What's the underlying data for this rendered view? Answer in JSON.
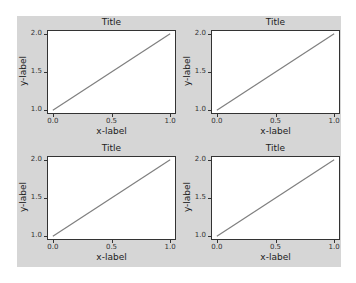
{
  "figure": {
    "background": "#d6d6d6",
    "line_color": "#7f7f7f"
  },
  "chart_data": [
    {
      "type": "line",
      "position": "top-left",
      "title": "Title",
      "xlabel": "x-label",
      "ylabel": "y-label",
      "x": [
        0,
        1
      ],
      "series": [
        {
          "name": "line",
          "values": [
            1,
            2
          ]
        }
      ],
      "xticks": [
        "0.0",
        "0.5",
        "1.0"
      ],
      "yticks": [
        "1.0",
        "1.5",
        "2.0"
      ],
      "xlim": [
        -0.05,
        1.05
      ],
      "ylim": [
        0.95,
        2.05
      ],
      "grid": false
    },
    {
      "type": "line",
      "position": "top-right",
      "title": "Title",
      "xlabel": "x-label",
      "ylabel": "y-label",
      "x": [
        0,
        1
      ],
      "series": [
        {
          "name": "line",
          "values": [
            1,
            2
          ]
        }
      ],
      "xticks": [
        "0.0",
        "0.5",
        "1.0"
      ],
      "yticks": [
        "1.0",
        "1.5",
        "2.0"
      ],
      "xlim": [
        -0.05,
        1.05
      ],
      "ylim": [
        0.95,
        2.05
      ],
      "grid": false
    },
    {
      "type": "line",
      "position": "bottom-left",
      "title": "Title",
      "xlabel": "x-label",
      "ylabel": "y-label",
      "x": [
        0,
        1
      ],
      "series": [
        {
          "name": "line",
          "values": [
            1,
            2
          ]
        }
      ],
      "xticks": [
        "0.0",
        "0.5",
        "1.0"
      ],
      "yticks": [
        "1.0",
        "1.5",
        "2.0"
      ],
      "xlim": [
        -0.05,
        1.05
      ],
      "ylim": [
        0.95,
        2.05
      ],
      "grid": false
    },
    {
      "type": "line",
      "position": "bottom-right",
      "title": "Title",
      "xlabel": "x-label",
      "ylabel": "y-label",
      "x": [
        0,
        1
      ],
      "series": [
        {
          "name": "line",
          "values": [
            1,
            2
          ]
        }
      ],
      "xticks": [
        "0.0",
        "0.5",
        "1.0"
      ],
      "yticks": [
        "1.0",
        "1.5",
        "2.0"
      ],
      "xlim": [
        -0.05,
        1.05
      ],
      "ylim": [
        0.95,
        2.05
      ],
      "grid": false
    }
  ]
}
